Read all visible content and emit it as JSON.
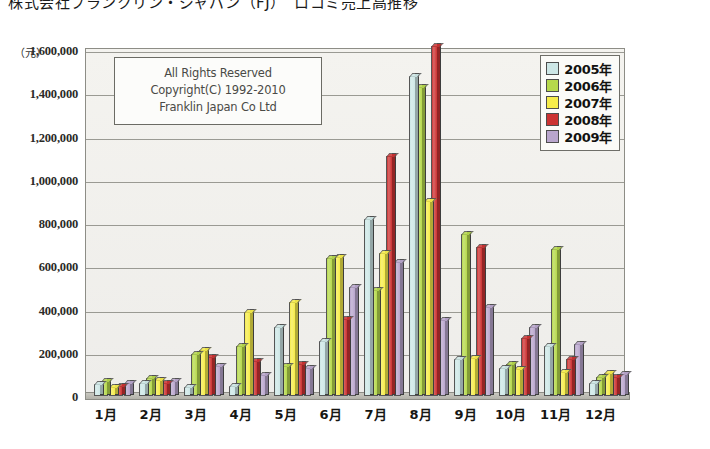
{
  "document": {
    "title_line": "株式会社フランクリン・ジャパン（FJ）　ロコミ売上高推移"
  },
  "copyright": {
    "line1": "All Rights Reserved",
    "line2": "Copyright(C) 1992-2010",
    "line3": "Franklin Japan Co Ltd"
  },
  "legend": {
    "position": "top-right",
    "entries": [
      {
        "label": "2005年",
        "color": "#cde7e6"
      },
      {
        "label": "2006年",
        "color": "#b6d94c"
      },
      {
        "label": "2007年",
        "color": "#f6ec4a"
      },
      {
        "label": "2008年",
        "color": "#cc3333"
      },
      {
        "label": "2009年",
        "color": "#b9a6cd"
      }
    ]
  },
  "axes": {
    "y_unit": "（元）",
    "y_ticks": [
      "1,600,000",
      "1,400,000",
      "1,200,000",
      "1,000,000",
      "800,000",
      "600,000",
      "400,000",
      "200,000",
      "0"
    ],
    "x_ticks": [
      "1月",
      "2月",
      "3月",
      "4月",
      "5月",
      "6月",
      "7月",
      "8月",
      "9月",
      "10月",
      "11月",
      "12月"
    ]
  },
  "chart_data": {
    "type": "bar",
    "title": "株式会社フランクリン・ジャパン（FJ）　ロコミ売上高推移",
    "xlabel": "",
    "ylabel": "（元）",
    "ylim": [
      0,
      1600000
    ],
    "ytick_step": 200000,
    "grid": true,
    "legend_position": "top-right",
    "categories": [
      "1月",
      "2月",
      "3月",
      "4月",
      "5月",
      "6月",
      "7月",
      "8月",
      "9月",
      "10月",
      "11月",
      "12月"
    ],
    "series": [
      {
        "name": "2005年",
        "color": "#cde7e6",
        "values": [
          55000,
          60000,
          40000,
          45000,
          320000,
          255000,
          820000,
          1480000,
          170000,
          130000,
          230000,
          60000
        ]
      },
      {
        "name": "2006年",
        "color": "#b6d94c",
        "values": [
          70000,
          85000,
          195000,
          230000,
          140000,
          640000,
          490000,
          1430000,
          750000,
          150000,
          680000,
          90000
        ]
      },
      {
        "name": "2007年",
        "color": "#f6ec4a",
        "values": [
          40000,
          75000,
          215000,
          390000,
          435000,
          645000,
          660000,
          900000,
          175000,
          125000,
          110000,
          105000
        ]
      },
      {
        "name": "2008年",
        "color": "#cc3333",
        "values": [
          45000,
          60000,
          180000,
          160000,
          150000,
          355000,
          1110000,
          1620000,
          690000,
          270000,
          170000,
          90000
        ]
      },
      {
        "name": "2009年",
        "color": "#b9a6cd",
        "values": [
          60000,
          70000,
          140000,
          95000,
          130000,
          505000,
          620000,
          350000,
          410000,
          320000,
          240000,
          100000
        ]
      }
    ]
  }
}
